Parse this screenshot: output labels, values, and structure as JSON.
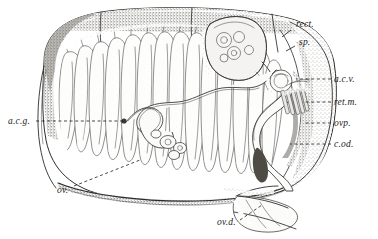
{
  "figure": {
    "domain_kind": "anatomical-line-drawing",
    "technique": "pen-and-ink stipple and line engraving",
    "background_color": "#ffffff",
    "ink_color": "#2b2b2b",
    "width": 378,
    "height": 239
  },
  "labels": [
    {
      "id": "rect",
      "text": "rect.",
      "meaning": "rectum",
      "x": 296,
      "y": 27,
      "leader": {
        "type": "solid",
        "x1": 291,
        "y1": 30,
        "x2": 282,
        "y2": 37
      }
    },
    {
      "id": "sp",
      "text": "sp.",
      "meaning": "spermatheca",
      "x": 299,
      "y": 45,
      "leader": {
        "type": "solid",
        "x1": 295,
        "y1": 46,
        "x2": 286,
        "y2": 51
      }
    },
    {
      "id": "acv",
      "text": "a.c.v.",
      "meaning": "accessory gland vesicle",
      "x": 334,
      "y": 82,
      "leader": {
        "type": "dashed",
        "x1": 331,
        "y1": 79,
        "x2": 296,
        "y2": 79
      }
    },
    {
      "id": "retm",
      "text": "ret.m.",
      "meaning": "retractor muscle",
      "x": 334,
      "y": 105,
      "leader": {
        "type": "dashed",
        "x1": 331,
        "y1": 102,
        "x2": 304,
        "y2": 102
      }
    },
    {
      "id": "ovp",
      "text": "ovp.",
      "meaning": "ovipositor",
      "x": 334,
      "y": 126,
      "leader": {
        "type": "dashed",
        "x1": 331,
        "y1": 123,
        "x2": 304,
        "y2": 123
      }
    },
    {
      "id": "cod",
      "text": "c.od.",
      "meaning": "common oviduct",
      "x": 334,
      "y": 147,
      "leader": {
        "type": "dashed",
        "x1": 331,
        "y1": 144,
        "x2": 290,
        "y2": 144
      }
    },
    {
      "id": "acg",
      "text": "a.c.g.",
      "meaning": "accessory gland",
      "x": 8,
      "y": 124,
      "leader": {
        "type": "dashed",
        "x1": 36,
        "y1": 121,
        "x2": 124,
        "y2": 121
      }
    },
    {
      "id": "ov",
      "text": "ov.",
      "meaning": "ovary / ovarioles",
      "x": 57,
      "y": 193,
      "leader": {
        "type": "dashed",
        "x1": 74,
        "y1": 186,
        "x2": 140,
        "y2": 160
      }
    },
    {
      "id": "ovd",
      "text": "ov.d.",
      "meaning": "oviduct",
      "x": 217,
      "y": 225,
      "leader": {
        "type": "dashed",
        "x1": 240,
        "y1": 220,
        "x2": 262,
        "y2": 205
      }
    }
  ],
  "structures": [
    {
      "id": "carapace",
      "name": "abdominal tergites / body wall",
      "note": "stippled dark dorsal and posterior margin"
    },
    {
      "id": "ovarioles",
      "name": "ovarioles",
      "note": "elongate teardrop follicles in diagonal ranks, approx 13 columns"
    },
    {
      "id": "coiled-gland",
      "name": "coiled accessory gland tubule",
      "note": "sinuous looped tube across mid-body"
    },
    {
      "id": "spermatheca-mass",
      "name": "spermathecal complex",
      "note": "lobed mass with circular vesicles, upper right"
    },
    {
      "id": "retractor-muscles",
      "name": "retractor muscle bundle",
      "note": "parallel striated bands, right side"
    },
    {
      "id": "ovipositor-flap",
      "name": "ovipositor valves",
      "note": "angular pale flap at lower right"
    }
  ]
}
